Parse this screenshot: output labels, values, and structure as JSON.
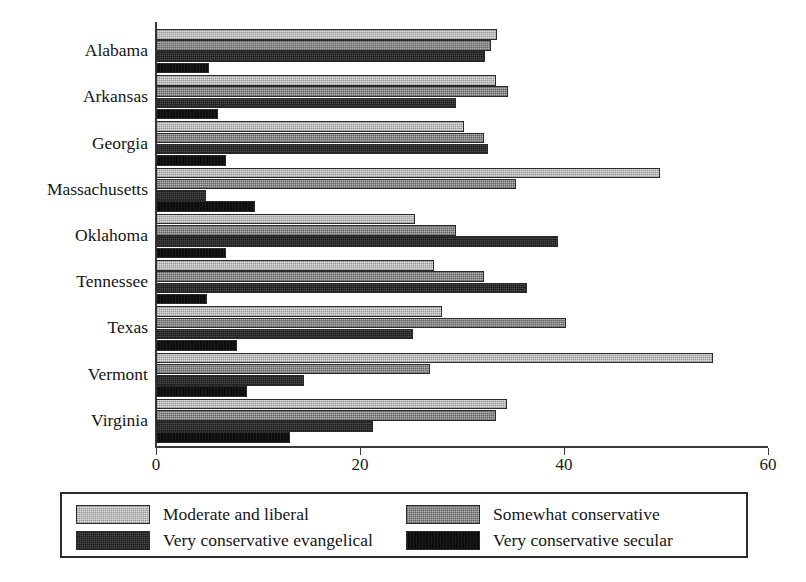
{
  "chart_data": {
    "type": "bar",
    "orientation": "horizontal",
    "title": "",
    "subtitle": "",
    "xlabel": "",
    "ylabel": "",
    "xlim": [
      0,
      60
    ],
    "xticks": [
      0,
      20,
      40,
      60
    ],
    "xtick_labels": [
      "0",
      "20",
      "40",
      "60"
    ],
    "grid": false,
    "legend_position": "bottom",
    "categories": [
      "Alabama",
      "Arkansas",
      "Georgia",
      "Massachusetts",
      "Oklahoma",
      "Tennessee",
      "Texas",
      "Vermont",
      "Virginia"
    ],
    "series": [
      {
        "name": "Moderate and liberal",
        "color": "#dedede",
        "values": [
          33.4,
          33.3,
          30.2,
          49.4,
          25.4,
          27.3,
          28.0,
          54.6,
          34.4
        ]
      },
      {
        "name": "Somewhat conservative",
        "color": "#b4b4b4",
        "values": [
          32.8,
          34.5,
          32.2,
          35.3,
          29.4,
          32.2,
          40.2,
          26.9,
          33.3
        ]
      },
      {
        "name": "Very conservative evangelical",
        "color": "#4b4b4b",
        "values": [
          32.3,
          29.4,
          32.5,
          4.9,
          39.4,
          36.4,
          25.2,
          14.5,
          21.3
        ]
      },
      {
        "name": "Very conservative secular",
        "color": "#0d0d0d",
        "values": [
          5.2,
          6.1,
          6.9,
          9.7,
          6.9,
          5.0,
          7.9,
          8.9,
          13.1
        ]
      }
    ]
  },
  "legend": {
    "entries": [
      {
        "label": "Moderate and liberal"
      },
      {
        "label": "Somewhat conservative"
      },
      {
        "label": "Very conservative evangelical"
      },
      {
        "label": "Very conservative secular"
      }
    ]
  }
}
